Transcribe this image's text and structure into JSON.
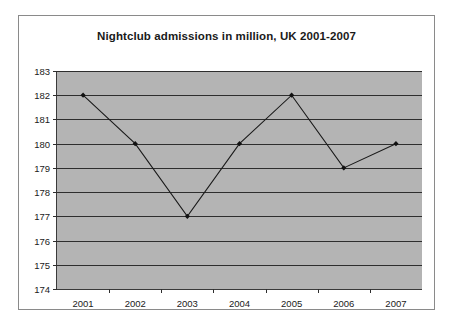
{
  "chart_data": {
    "type": "line",
    "title": "Nightclub admissions in million, UK 2001-2007",
    "xlabel": "",
    "ylabel": "",
    "categories": [
      "2001",
      "2002",
      "2003",
      "2004",
      "2005",
      "2006",
      "2007"
    ],
    "values": [
      182,
      180,
      177,
      180,
      182,
      179,
      180
    ],
    "series": [
      {
        "name": "Nightclub admissions",
        "values": [
          182,
          180,
          177,
          180,
          182,
          179,
          180
        ]
      }
    ],
    "ylim": [
      174,
      183
    ],
    "ytick_labels": [
      "183",
      "182",
      "181",
      "180",
      "179",
      "178",
      "177",
      "176",
      "175",
      "174"
    ],
    "ytick_values": [
      183,
      182,
      181,
      180,
      179,
      178,
      177,
      176,
      175,
      174
    ],
    "ytick_step": 1,
    "grid": true,
    "grid_axis": "y",
    "legend": false,
    "legend_position": "none",
    "marker": "diamond",
    "annotations": []
  },
  "style": {
    "plot_background": "#b4b4b4",
    "figure_background": "#ffffff",
    "gridline_color": "#2e2e2e",
    "axis_color": "#3a3a3a",
    "series_color": "#1a1a1a",
    "marker_color": "#111111",
    "text_color": "#1a1a1a",
    "border_color": "#8a8a8a"
  }
}
